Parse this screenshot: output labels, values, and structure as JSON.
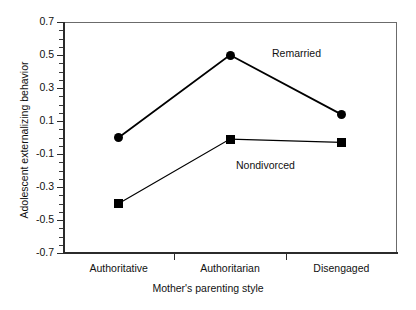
{
  "chart_data": {
    "type": "line",
    "title": "",
    "subtitle": "",
    "xlabel": "Mother's parenting style",
    "ylabel": "Adolescent externalizing behavior",
    "categories": [
      "Authoritative",
      "Authoritarian",
      "Disengaged"
    ],
    "series": [
      {
        "name": "Remarried",
        "marker": "circle",
        "values": [
          0.0,
          0.5,
          0.14
        ]
      },
      {
        "name": "Nondivorced",
        "marker": "square",
        "values": [
          -0.4,
          -0.01,
          -0.03
        ]
      }
    ],
    "ylim": [
      -0.7,
      0.7
    ],
    "ytick_values": [
      0.7,
      0.5,
      0.3,
      0.1,
      -0.1,
      -0.3,
      -0.5,
      -0.7
    ],
    "ytick_labels": [
      "0.7",
      "0.5",
      "0.3",
      "0.1",
      "-0.1",
      "-0.3",
      "-0.5",
      "-0.7"
    ],
    "ytick_minor_step": 0.05,
    "grid": false,
    "legend_position": "inline-annotation",
    "annotations": [
      {
        "text": "Remarried",
        "series": "Remarried"
      },
      {
        "text": "Nondivorced",
        "series": "Nondivorced"
      }
    ],
    "colors": {
      "line": "#000000",
      "marker": "#000000",
      "axis": "#2b2b2b",
      "frame": "#6b6b6b",
      "background": "#ffffff"
    }
  }
}
